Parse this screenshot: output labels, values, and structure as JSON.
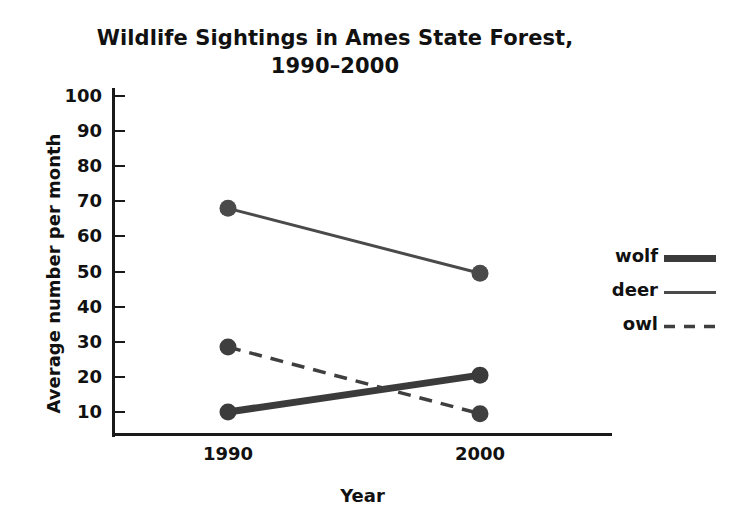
{
  "chart_data": {
    "type": "line",
    "title": "Wildlife Sightings in Ames State Forest, 1990–2000",
    "title_lines": [
      "Wildlife Sightings in Ames State Forest,",
      "1990–2000"
    ],
    "xlabel": "Year",
    "ylabel": "Average number per month",
    "categories": [
      "1990",
      "2000"
    ],
    "x": [
      1990,
      2000
    ],
    "xtick_labels": [
      "1990",
      "2000"
    ],
    "ytick_labels": [
      "100",
      "90",
      "80",
      "70",
      "60",
      "50",
      "40",
      "30",
      "20",
      "10"
    ],
    "ytick_values": [
      100,
      90,
      80,
      70,
      60,
      50,
      40,
      30,
      20,
      10
    ],
    "ylim": [
      0,
      100
    ],
    "grid": false,
    "legend_position": "right",
    "series": [
      {
        "name": "wolf",
        "label": "wolf",
        "values": [
          10,
          20.5
        ],
        "style": "solid-thick",
        "color": "#3b3b3b",
        "width": 7,
        "dash": "none",
        "marker": "circle"
      },
      {
        "name": "deer",
        "label": "deer",
        "values": [
          68,
          49.5
        ],
        "style": "solid-thin",
        "color": "#4a4a4a",
        "width": 3,
        "dash": "none",
        "marker": "circle"
      },
      {
        "name": "owl",
        "label": "owl",
        "values": [
          28.5,
          9.5
        ],
        "style": "dashed",
        "color": "#3f3f3f",
        "width": 3.5,
        "dash": "13,9",
        "marker": "circle"
      }
    ]
  },
  "colors": {
    "axis": "#1a1a1a",
    "text": "#111111",
    "background": "#ffffff"
  }
}
